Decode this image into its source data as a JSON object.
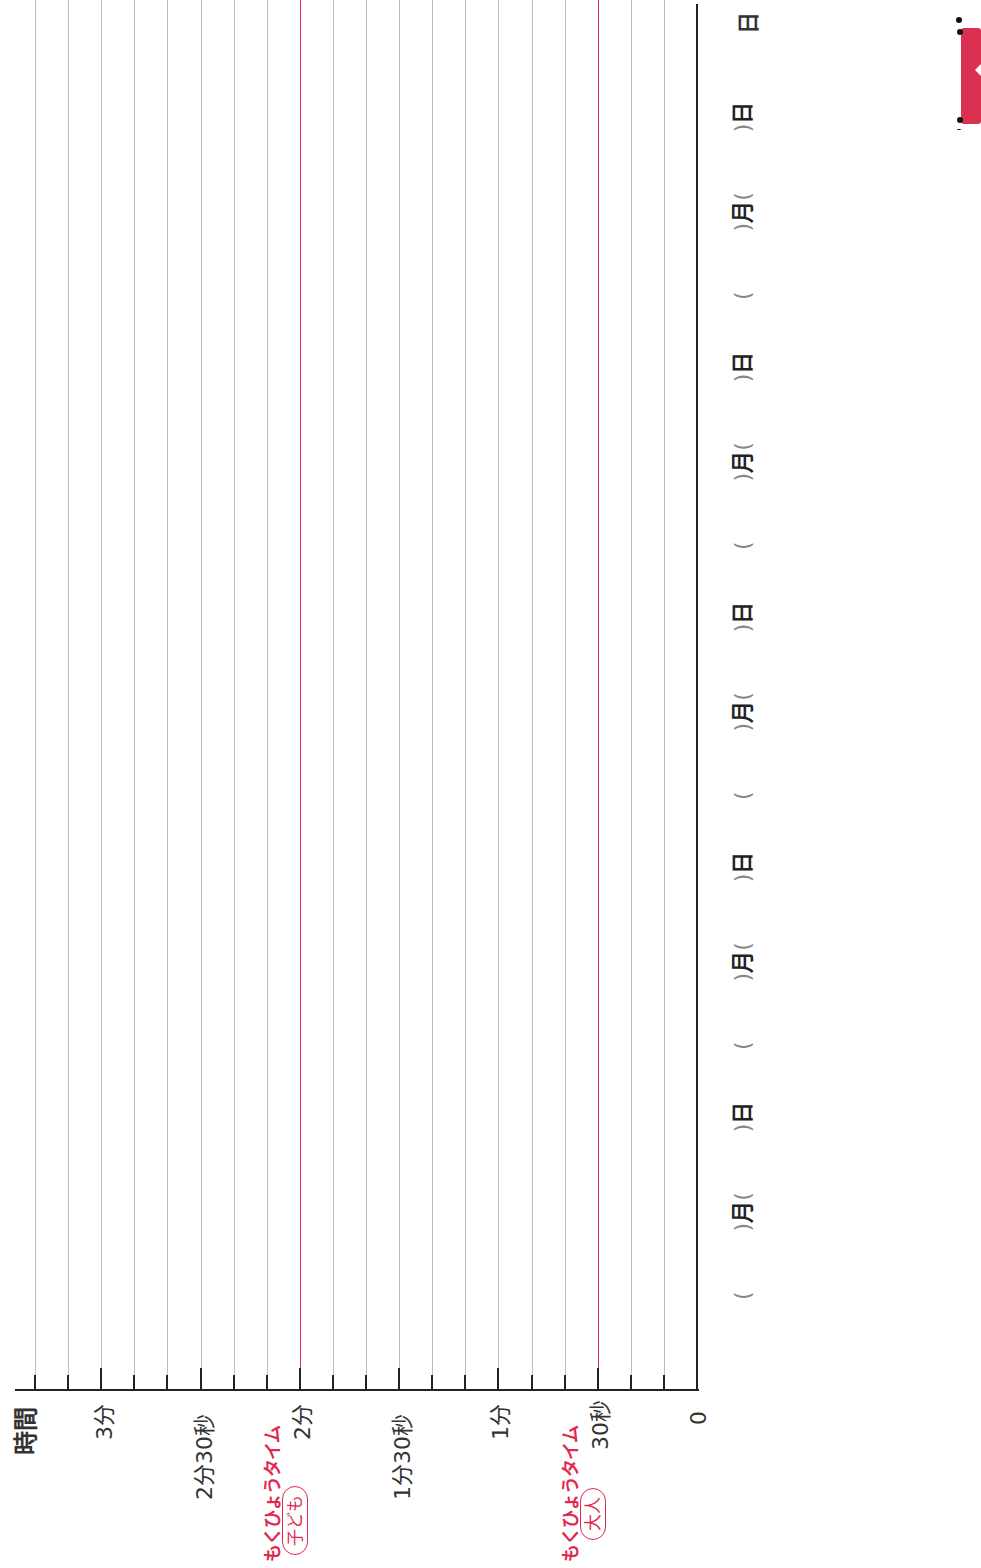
{
  "chart_data": {
    "type": "bar",
    "orientation": "rotated-90-ccw",
    "title": "",
    "ylabel": "時間",
    "xlabel": "日",
    "ylim_seconds": [
      0,
      200
    ],
    "grid_step_seconds": 10,
    "grid": true,
    "y_ticks": [
      {
        "seconds": 0,
        "label": "0"
      },
      {
        "seconds": 30,
        "label": "30秒",
        "target": true,
        "target_caption": "もくひょうタイム",
        "target_group": "大人"
      },
      {
        "seconds": 60,
        "label": "1分"
      },
      {
        "seconds": 90,
        "label": "1分30秒"
      },
      {
        "seconds": 120,
        "label": "2分",
        "target": true,
        "target_caption": "もくひょうタイム",
        "target_group": "子ども"
      },
      {
        "seconds": 150,
        "label": "2分30秒"
      },
      {
        "seconds": 180,
        "label": "3分"
      }
    ],
    "categories": [
      "(  )月(  )日",
      "(  )月(  )日",
      "(  )月(  )日",
      "(  )月(  )日",
      "(  )月(  )日"
    ],
    "values": [
      null,
      null,
      null,
      null,
      null
    ],
    "reference_lines": [
      {
        "seconds": 30,
        "label": "もくひょうタイム 大人",
        "color": "#e0294e"
      },
      {
        "seconds": 120,
        "label": "もくひょうタイム 子ども",
        "color": "#e0294e"
      }
    ]
  },
  "axis": {
    "title": "時間",
    "x_title": "日",
    "labels": {
      "zero": "0",
      "s30": "30秒",
      "m1": "1分",
      "m1s30": "1分30秒",
      "m2": "2分",
      "m2s30": "2分30秒",
      "m3": "3分"
    },
    "target_caption": "もくひょうタイム",
    "target_child": "子ども",
    "target_adult": "大人"
  },
  "dates": [
    {
      "open": "(",
      "close": ")",
      "month": "月",
      "day": "日"
    },
    {
      "open": "(",
      "close": ")",
      "month": "月",
      "day": "日"
    },
    {
      "open": "(",
      "close": ")",
      "month": "月",
      "day": "日"
    },
    {
      "open": "(",
      "close": ")",
      "month": "月",
      "day": "日"
    },
    {
      "open": "(",
      "close": ")",
      "month": "月",
      "day": "日"
    }
  ],
  "colors": {
    "target": "#e0294e",
    "grid": "#bdbdbd",
    "axis": "#222222"
  }
}
